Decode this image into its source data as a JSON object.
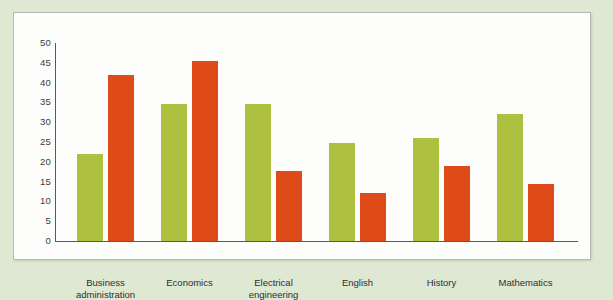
{
  "figure": {
    "background_color": "#dee8d2",
    "panel_color": "#fdfdfb",
    "panel_border_color": "#b6bcb4",
    "axis_color": "#59595b"
  },
  "chart_data": {
    "type": "bar",
    "title": "",
    "subtitle": "",
    "xlabel": "",
    "ylabel": "",
    "ylim": [
      0,
      50
    ],
    "ytick_labels": [
      "0",
      "5",
      "10",
      "15",
      "20",
      "25",
      "30",
      "35",
      "40",
      "45",
      "50"
    ],
    "yticks": [
      0,
      5,
      10,
      15,
      20,
      25,
      30,
      35,
      40,
      45,
      50
    ],
    "grid": false,
    "legend": false,
    "legend_position": "none",
    "categories": [
      "Business\nadministration",
      "Economics",
      "Electrical\nengineering",
      "English",
      "History",
      "Mathematics"
    ],
    "series": [
      {
        "name": "Series A",
        "color": "#aec03f",
        "values": [
          22,
          34.5,
          34.5,
          24.7,
          26,
          32
        ]
      },
      {
        "name": "Series B",
        "color": "#df4a19",
        "values": [
          42,
          45.5,
          17.7,
          12,
          19,
          14.5
        ]
      }
    ]
  }
}
